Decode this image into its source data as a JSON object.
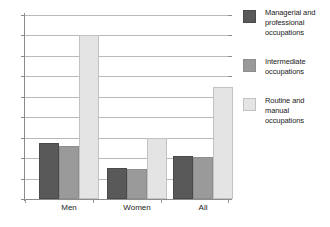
{
  "chart_data": {
    "type": "bar",
    "title": "",
    "xlabel": "",
    "ylabel": "",
    "categories": [
      "Men",
      "Women",
      "All"
    ],
    "series": [
      {
        "name": "Managerial and professional occupations",
        "values": [
          13.7,
          7.7,
          10.6
        ],
        "color": "#595959"
      },
      {
        "name": "Intermediate occupations",
        "values": [
          13.0,
          7.4,
          10.2
        ],
        "color": "#9a9a9a"
      },
      {
        "name": "Routine and manual occupations",
        "values": [
          40.2,
          14.9,
          27.4
        ],
        "color": "#e4e4e4"
      }
    ],
    "ylim": [
      0,
      45
    ],
    "yticks": [
      0,
      5,
      10,
      15,
      20,
      25,
      30,
      35,
      40,
      45
    ],
    "ytick_labels": [
      "0",
      "5",
      "10",
      "15",
      "20",
      "25",
      "30",
      "35",
      "40",
      "45"
    ],
    "grid": true,
    "legend_position": "right"
  },
  "legend": {
    "items": [
      {
        "label_line1": "Managerial and",
        "label_line2": "professional",
        "label_line3": "occupations",
        "swatch": "dark-gray-swatch"
      },
      {
        "label_line1": "Intermediate",
        "label_line2": "occupations",
        "label_line3": "",
        "swatch": "medium-gray-swatch"
      },
      {
        "label_line1": "Routine and",
        "label_line2": "manual",
        "label_line3": "occupations",
        "swatch": "light-gray-swatch"
      }
    ]
  },
  "axis": {
    "y_labels": [
      "45",
      "40",
      "35",
      "30",
      "25",
      "20",
      "15",
      "10",
      "5",
      "0"
    ],
    "x_labels": [
      "Men",
      "Women",
      "All"
    ]
  }
}
